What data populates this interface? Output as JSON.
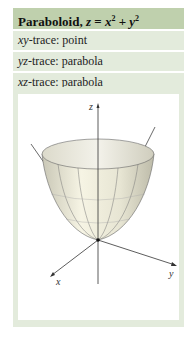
{
  "header": {
    "title_prefix": "Paraboloid, ",
    "equation": "z = x² + y²",
    "eq_lhs": "z",
    "eq_op": " = ",
    "eq_term1": "x",
    "eq_exp1": "2",
    "eq_plus": " + ",
    "eq_term2": "y",
    "eq_exp2": "2"
  },
  "traces": [
    {
      "plane": "xy",
      "label": "-trace: point"
    },
    {
      "plane": "yz",
      "label": "-trace: parabola"
    },
    {
      "plane": "xz",
      "label": "-trace: parabola"
    }
  ],
  "figure": {
    "axis_labels": {
      "z": "z",
      "x": "x",
      "y": "y"
    },
    "colors": {
      "header_bg": "#bfd0ad",
      "row_bg": "#e3ebdc",
      "surface": "#ece9d6",
      "axis": "#333333"
    }
  }
}
